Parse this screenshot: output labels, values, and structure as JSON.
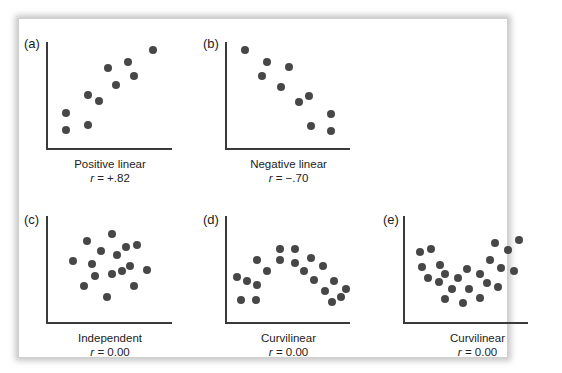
{
  "chart_data": [
    {
      "type": "scatter",
      "panel_label": "(a)",
      "title": "Positive linear",
      "r_label": "r",
      "r_value": "= +.82",
      "points": [
        [
          66,
          130
        ],
        [
          66,
          113
        ],
        [
          88,
          125
        ],
        [
          88,
          95
        ],
        [
          99,
          101
        ],
        [
          108,
          68
        ],
        [
          116,
          85
        ],
        [
          128,
          62
        ],
        [
          134,
          76
        ],
        [
          153,
          50
        ]
      ]
    },
    {
      "type": "scatter",
      "panel_label": "(b)",
      "title": "Negative linear",
      "r_label": "r",
      "r_value": "= −.70",
      "points": [
        [
          245,
          50
        ],
        [
          267,
          62
        ],
        [
          262,
          76
        ],
        [
          289,
          67
        ],
        [
          281,
          87
        ],
        [
          299,
          102
        ],
        [
          309,
          96
        ],
        [
          311,
          126
        ],
        [
          331,
          114
        ],
        [
          331,
          131
        ]
      ]
    },
    {
      "type": "scatter",
      "panel_label": "(c)",
      "title": "Independent",
      "r_label": "r",
      "r_value": "= 0.00",
      "points": [
        [
          73,
          261
        ],
        [
          87,
          241
        ],
        [
          84,
          286
        ],
        [
          92,
          264
        ],
        [
          95,
          276
        ],
        [
          101,
          251
        ],
        [
          112,
          234
        ],
        [
          107,
          297
        ],
        [
          112,
          274
        ],
        [
          117,
          255
        ],
        [
          122,
          271
        ],
        [
          126,
          247
        ],
        [
          130,
          266
        ],
        [
          134,
          286
        ],
        [
          137,
          245
        ],
        [
          147,
          270
        ]
      ]
    },
    {
      "type": "scatter",
      "panel_label": "(d)",
      "title": "Curvilinear",
      "r_label": "r",
      "r_value": "= 0.00",
      "points": [
        [
          237,
          277
        ],
        [
          241,
          300
        ],
        [
          247,
          281
        ],
        [
          256,
          300
        ],
        [
          257,
          285
        ],
        [
          257,
          260
        ],
        [
          267,
          271
        ],
        [
          280,
          249
        ],
        [
          280,
          260
        ],
        [
          295,
          249
        ],
        [
          295,
          263
        ],
        [
          304,
          271
        ],
        [
          311,
          258
        ],
        [
          314,
          280
        ],
        [
          323,
          266
        ],
        [
          325,
          291
        ],
        [
          334,
          281
        ],
        [
          332,
          302
        ],
        [
          341,
          297
        ],
        [
          346,
          289
        ]
      ]
    },
    {
      "type": "scatter",
      "panel_label": "(e)",
      "title": "Curvilinear",
      "r_label": "r",
      "r_value": "= 0.00",
      "points": [
        [
          420,
          252
        ],
        [
          431,
          249
        ],
        [
          422,
          267
        ],
        [
          428,
          278
        ],
        [
          439,
          282
        ],
        [
          440,
          265
        ],
        [
          445,
          274
        ],
        [
          452,
          289
        ],
        [
          445,
          299
        ],
        [
          458,
          278
        ],
        [
          467,
          269
        ],
        [
          463,
          303
        ],
        [
          469,
          289
        ],
        [
          480,
          274
        ],
        [
          480,
          298
        ],
        [
          487,
          283
        ],
        [
          490,
          260
        ],
        [
          495,
          243
        ],
        [
          498,
          287
        ],
        [
          501,
          268
        ],
        [
          508,
          250
        ],
        [
          514,
          271
        ],
        [
          519,
          240
        ]
      ]
    }
  ]
}
